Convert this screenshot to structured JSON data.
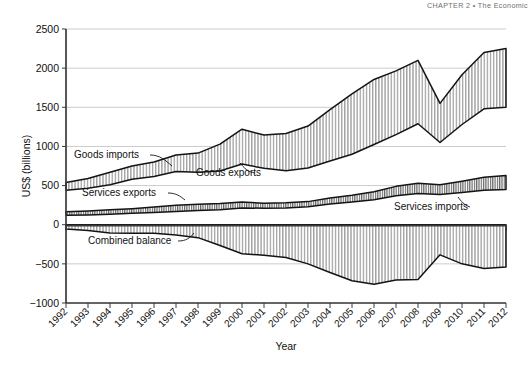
{
  "running_head": "CHAPTER 2   •   The Economic",
  "axes": {
    "y_label": "US$ (billions)",
    "x_label": "Year",
    "y_ticks": [
      2500,
      2000,
      1500,
      1000,
      500,
      0,
      -500,
      -1000
    ],
    "y_tick_labels": [
      "2500",
      "2000",
      "1500",
      "1000",
      "500",
      "0",
      "−500",
      "−1000"
    ],
    "ylim": [
      -1000,
      2500
    ],
    "x_ticks": [
      "1992",
      "1993",
      "1994",
      "1995",
      "1996",
      "1997",
      "1998",
      "1999",
      "2000",
      "2001",
      "2002",
      "2003",
      "2004",
      "2005",
      "2006",
      "2007",
      "2008",
      "2009",
      "2010",
      "2011",
      "2012"
    ]
  },
  "annotations": [
    {
      "name": "goods-imports",
      "label": "Goods imports",
      "x": 74,
      "y": 158
    },
    {
      "name": "goods-exports",
      "label": "Goods exports",
      "x": 196,
      "y": 176
    },
    {
      "name": "services-exports",
      "label": "Services exports",
      "x": 82,
      "y": 196
    },
    {
      "name": "services-imports",
      "label": "Services imports",
      "x": 394,
      "y": 210
    },
    {
      "name": "combined-balance",
      "label": "Combined balance",
      "x": 88,
      "y": 244
    }
  ],
  "chart_data": {
    "type": "area",
    "title": "",
    "xlabel": "Year",
    "ylabel": "US$ (billions)",
    "ylim": [
      -1000,
      2500
    ],
    "grid": true,
    "legend_position": "inline-annotations",
    "x": [
      1992,
      1993,
      1994,
      1995,
      1996,
      1997,
      1998,
      1999,
      2000,
      2001,
      2002,
      2003,
      2004,
      2005,
      2006,
      2007,
      2008,
      2009,
      2010,
      2011,
      2012
    ],
    "series": [
      {
        "name": "Goods imports",
        "values": [
          540,
          590,
          670,
          750,
          800,
          890,
          915,
          1030,
          1220,
          1145,
          1165,
          1260,
          1470,
          1670,
          1855,
          1965,
          2100,
          1550,
          1915,
          2200,
          2250
        ]
      },
      {
        "name": "Goods exports",
        "values": [
          440,
          465,
          510,
          580,
          615,
          680,
          670,
          685,
          775,
          720,
          690,
          725,
          815,
          900,
          1025,
          1150,
          1290,
          1050,
          1280,
          1480,
          1500
        ]
      },
      {
        "name": "Services exports",
        "values": [
          165,
          175,
          190,
          205,
          225,
          250,
          260,
          270,
          290,
          275,
          280,
          295,
          340,
          375,
          420,
          490,
          530,
          510,
          555,
          605,
          630
        ]
      },
      {
        "name": "Services imports",
        "values": [
          120,
          125,
          135,
          145,
          155,
          170,
          180,
          190,
          215,
          210,
          215,
          230,
          265,
          290,
          320,
          370,
          400,
          385,
          410,
          440,
          450
        ]
      },
      {
        "name": "Combined balance",
        "values": [
          -55,
          -75,
          -105,
          -110,
          -110,
          -130,
          -165,
          -265,
          -370,
          -390,
          -420,
          -500,
          -610,
          -715,
          -760,
          -705,
          -700,
          -385,
          -500,
          -560,
          -540
        ]
      }
    ]
  }
}
